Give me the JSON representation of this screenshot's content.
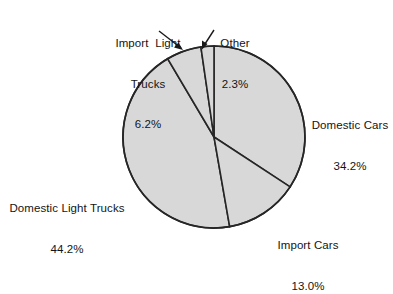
{
  "chart_data": {
    "type": "pie",
    "title": "",
    "subtitle": "",
    "xlabel": "",
    "ylabel": "",
    "legend": "none",
    "grid": false,
    "units": "percent",
    "categories": [
      "Domestic Cars",
      "Import Cars",
      "Domestic Light Trucks",
      "Import Light Trucks",
      "Other"
    ],
    "values": [
      34.2,
      13.0,
      44.2,
      6.2,
      2.3
    ],
    "slices": [
      {
        "name": "Domestic Cars",
        "label": "Domestic Cars",
        "value": 34.2,
        "value_label": "34.2%",
        "start_angle_deg": 8.3,
        "end_angle_deg": 131.4,
        "fill": "#d8d8d8",
        "stroke": "#262626"
      },
      {
        "name": "Import Cars",
        "label": "Import Cars",
        "value": 13.0,
        "value_label": "13.0%",
        "start_angle_deg": 131.4,
        "end_angle_deg": 178.2,
        "fill": "#d8d8d8",
        "stroke": "#262626"
      },
      {
        "name": "Domestic Light Trucks",
        "label": "Domestic Light Trucks",
        "value": 44.2,
        "value_label": "44.2%",
        "start_angle_deg": 178.2,
        "end_angle_deg": 337.3,
        "fill": "#d8d8d8",
        "stroke": "#262626"
      },
      {
        "name": "Import Light Trucks",
        "label": "Import  Light",
        "label_line2": "Trucks",
        "value": 6.2,
        "value_label": "6.2%",
        "start_angle_deg": 337.3,
        "end_angle_deg": 359.6,
        "fill": "#d8d8d8",
        "stroke": "#262626"
      },
      {
        "name": "Other",
        "label": "Other",
        "value": 2.3,
        "value_label": "2.3%",
        "start_angle_deg": 359.6,
        "end_angle_deg": 368.3,
        "fill": "#d8d8d8",
        "stroke": "#262626"
      }
    ],
    "colors": {
      "slice_fill": "#d8d8d8",
      "outline": "#262626",
      "background": "#ffffff",
      "text": "#141414"
    },
    "geometry": {
      "center_x": 214,
      "center_y": 137,
      "radius": 91
    }
  },
  "labels": {
    "import_light_trucks": {
      "line1": "Import  Light",
      "line2": "Trucks",
      "line3": "6.2%"
    },
    "other": {
      "line1": "Other",
      "line2": "2.3%"
    },
    "domestic_cars": {
      "line1": "Domestic Cars",
      "line2": "34.2%"
    },
    "domestic_light_trucks": {
      "line1": "Domestic Light Trucks",
      "line2": "44.2%"
    },
    "import_cars": {
      "line1": "Import Cars",
      "line2": "13.0%"
    }
  }
}
